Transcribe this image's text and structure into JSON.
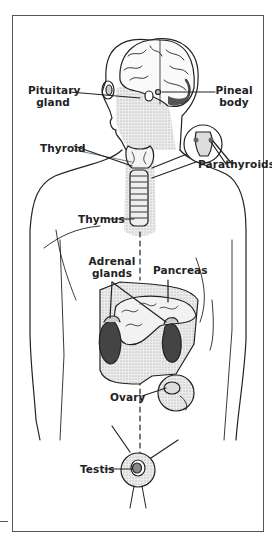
{
  "labels": {
    "pituitary_line1": "Pituitary",
    "pituitary_line2": "gland",
    "pineal_line1": "Pineal",
    "pineal_line2": "body",
    "thyroid": "Thyroid",
    "parathyroids": "Parathyroids",
    "thymus": "Thymus",
    "adrenal_line1": "Adrenal",
    "adrenal_line2": "glands",
    "pancreas": "Pancreas",
    "ovary": "Ovary",
    "testis": "Testis"
  },
  "colors": {
    "line": "#222222",
    "shade": "#d4d4d4",
    "dark": "#3a3a3a",
    "frame": "#555555"
  }
}
